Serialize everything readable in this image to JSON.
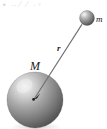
{
  "figure": {
    "kind": "physics-diagram",
    "background_color": "#ffffff",
    "width": 107,
    "height": 129
  },
  "labels": {
    "large_mass": "M",
    "small_mass": "m",
    "vector": "r"
  },
  "bodies": [
    {
      "id": "large-sphere",
      "label": "M",
      "center_x": 35,
      "center_y": 100,
      "radius": 28,
      "shade_light": "#e2e2e2",
      "shade_mid": "#9a9a9a",
      "shade_dark": "#4a4a4a",
      "highlight_x": 24,
      "highlight_y": 86
    },
    {
      "id": "small-sphere",
      "label": "m",
      "center_x": 87,
      "center_y": 18,
      "radius": 7.5,
      "shade_light": "#dcdcdc",
      "shade_mid": "#8f8f8f",
      "shade_dark": "#3f3f3f",
      "highlight_x": 84,
      "highlight_y": 14
    }
  ],
  "vector_arrow": {
    "label": "r",
    "from_x": 82,
    "from_y": 25,
    "to_x": 33,
    "to_y": 99,
    "stroke_color": "#6d6d6d",
    "stroke_width": 1.1,
    "head_color": "#2b2b2b"
  },
  "top_artifacts": {
    "fragments": [
      "▪",
      "··",
      "⁄",
      "⁄",
      "·",
      "◦"
    ]
  }
}
